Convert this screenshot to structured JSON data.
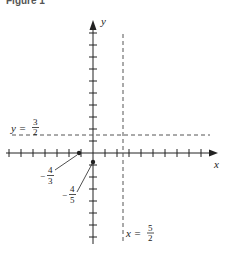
{
  "figure": {
    "caption": "Figure 1",
    "axes": {
      "x_label": "x",
      "y_label": "y",
      "tick_spacing_units": 1
    },
    "asymptotes": {
      "horizontal": {
        "label_lhs": "y =",
        "num": "3",
        "den": "2",
        "value": 1.5
      },
      "vertical": {
        "label_lhs": "x =",
        "num": "5",
        "den": "2",
        "value": 2.5
      }
    },
    "points": [
      {
        "name": "x-intercept",
        "sign": "−",
        "num": "4",
        "den": "3",
        "x": -1.333,
        "y": 0
      },
      {
        "name": "y-intercept",
        "sign": "−",
        "num": "4",
        "den": "5",
        "x": 0,
        "y": -0.8
      }
    ],
    "colors": {
      "ink": "#222222",
      "dashed": "#555555"
    }
  }
}
